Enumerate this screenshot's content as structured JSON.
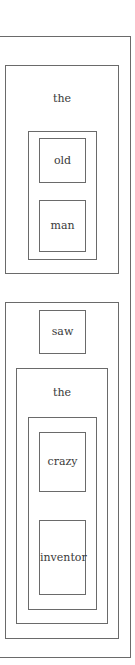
{
  "diagram": {
    "type": "nested-constituency-boxes",
    "sentence": "the old man saw the crazy inventor",
    "nodes": {
      "np1_det": "the",
      "old": "old",
      "man": "man",
      "saw": "saw",
      "np2_det": "the",
      "crazy": "crazy",
      "inventor": "inventor"
    },
    "border_color": "#6a6a6a",
    "text_color": "#3a3a3a"
  }
}
